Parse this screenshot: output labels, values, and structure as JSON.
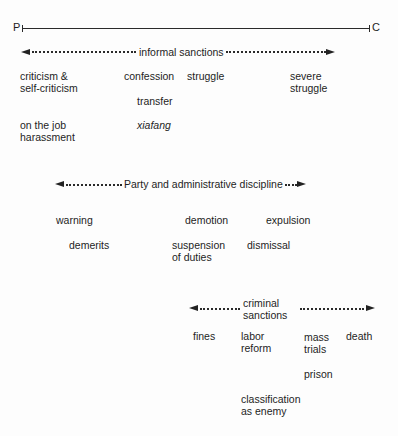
{
  "axis": {
    "left_label": "P",
    "right_label": "C"
  },
  "ranges": {
    "informal": {
      "label": "informal sanctions"
    },
    "party": {
      "label": "Party and administrative discipline"
    },
    "criminal": {
      "label_line1": "criminal",
      "label_line2": "sanctions"
    }
  },
  "informal_items": {
    "criticism": [
      "criticism &",
      "self-criticism"
    ],
    "confession": "confession",
    "struggle": "struggle",
    "severe_struggle": [
      "severe",
      "struggle"
    ],
    "transfer": "transfer",
    "on_the_job": [
      "on the job",
      "harassment"
    ],
    "xiafang": "xiafang"
  },
  "party_items": {
    "warning": "warning",
    "demotion": "demotion",
    "expulsion": "expulsion",
    "demerits": "demerits",
    "suspension": [
      "suspension",
      "of duties"
    ],
    "dismissal": "dismissal"
  },
  "criminal_items": {
    "fines": "fines",
    "labor_reform": [
      "labor",
      "reform"
    ],
    "mass_trials": [
      "mass",
      "trials"
    ],
    "death": "death",
    "prison": "prison",
    "classification": [
      "classification",
      "as enemy"
    ]
  }
}
